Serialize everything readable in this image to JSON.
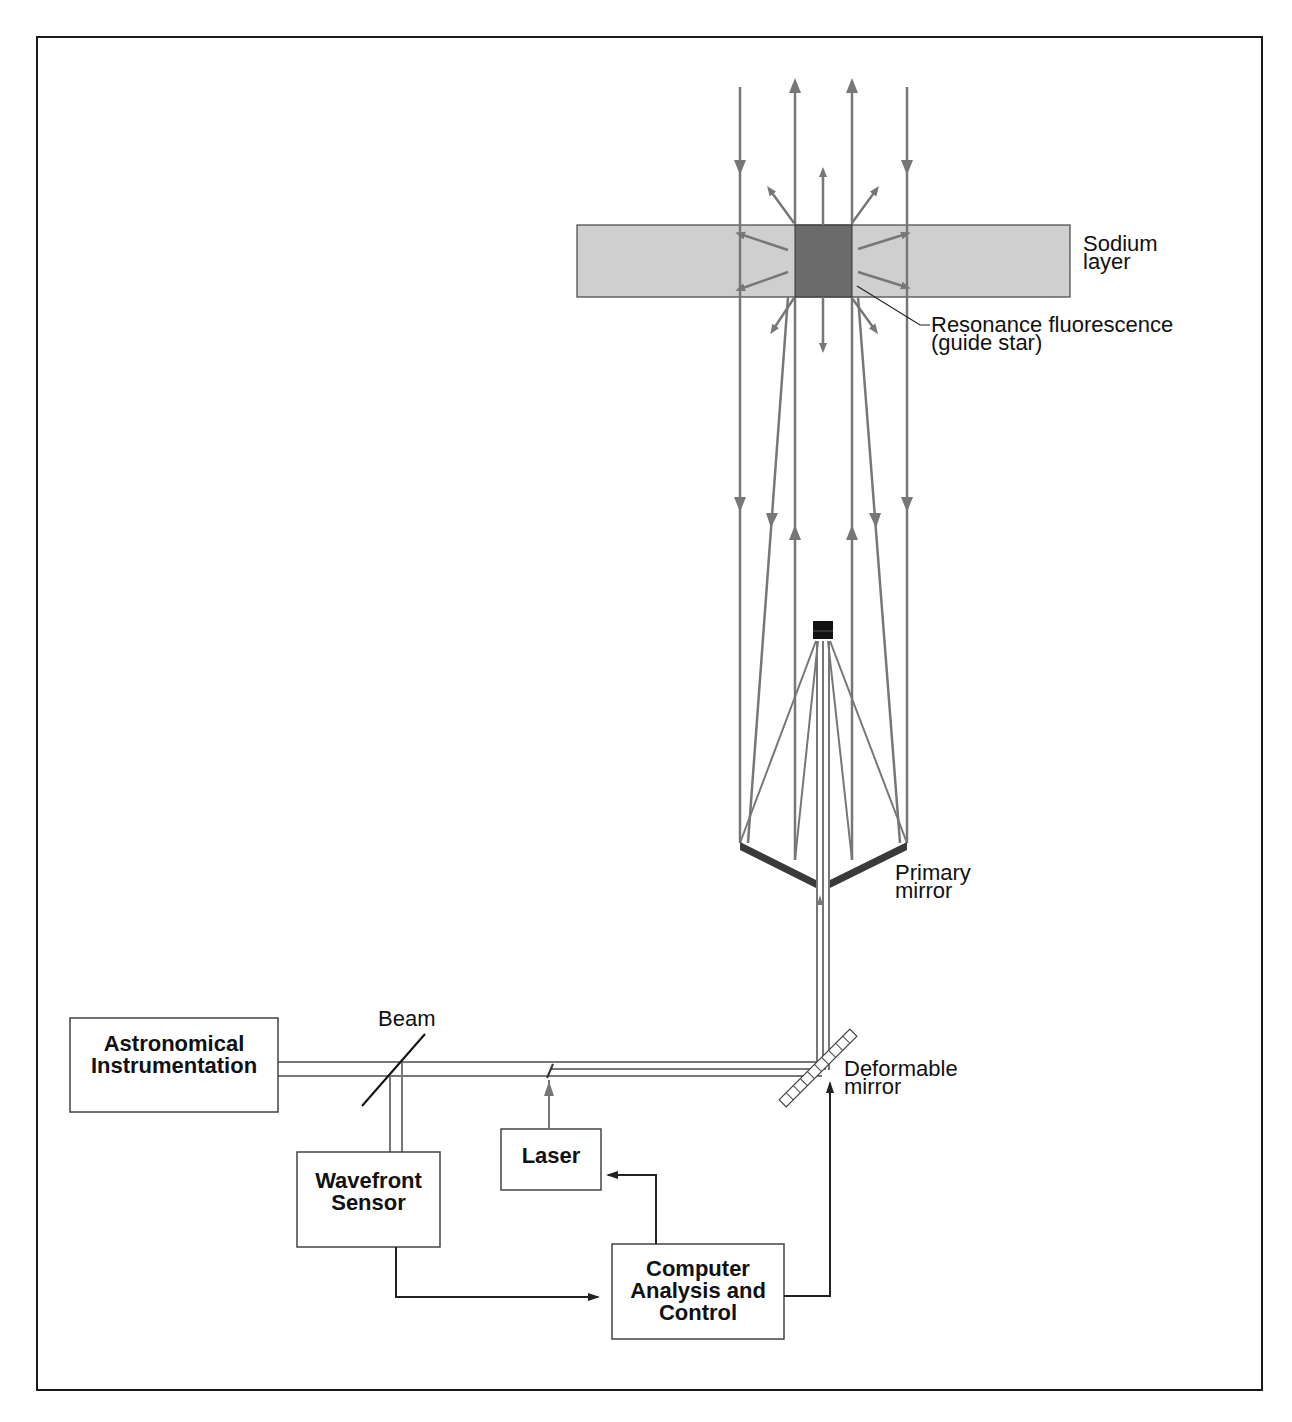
{
  "diagram": {
    "labels": {
      "sodium_layer": [
        "Sodium",
        "layer"
      ],
      "guide_star": [
        "Resonance fluorescence",
        "(guide star)"
      ],
      "primary_mirror": [
        "Primary",
        "mirror"
      ],
      "deformable_mirror": [
        "Deformable",
        "mirror"
      ],
      "beam": "Beam"
    },
    "boxes": {
      "astronomical_instrumentation": [
        "Astronomical",
        "Instrumentation"
      ],
      "wavefront_sensor": [
        "Wavefront",
        "Sensor"
      ],
      "laser": [
        "Laser"
      ],
      "computer": [
        "Computer",
        "Analysis and",
        "Control"
      ]
    },
    "colors": {
      "frame": "#1a1a1a",
      "beam_line": "#777777",
      "sodium_layer": "#cfcfcf",
      "guide_star": "#6b6b6b",
      "mirror": "#3a3a3a",
      "control_line": "#222222"
    }
  }
}
